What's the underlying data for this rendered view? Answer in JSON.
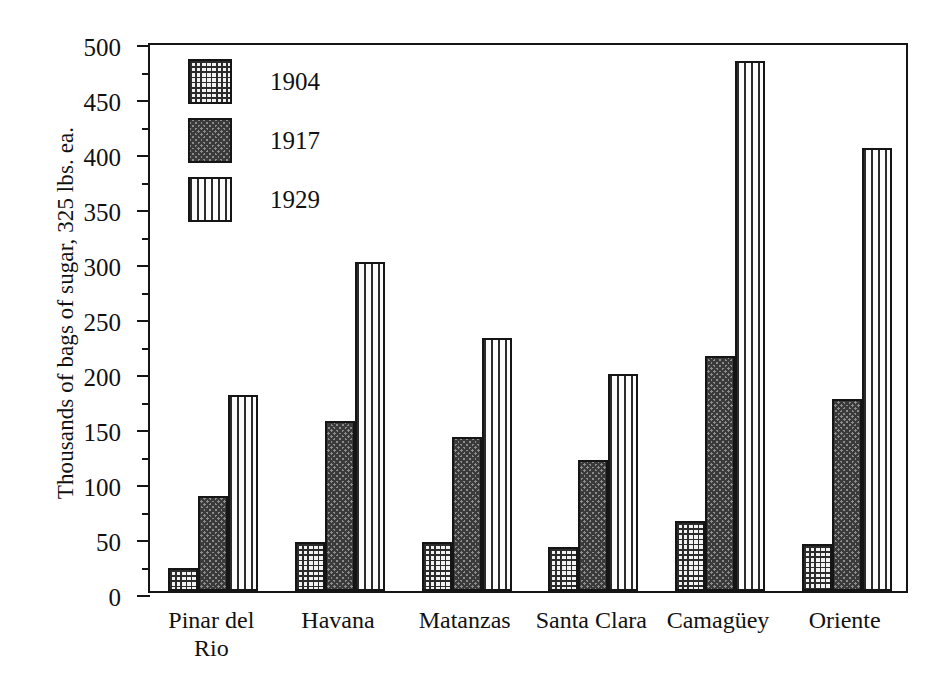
{
  "chart_data": {
    "type": "bar",
    "title": "",
    "xlabel": "",
    "ylabel": "Thousands of bags of sugar, 325 lbs. ea.",
    "ylim": [
      0,
      500
    ],
    "ytick_step": 50,
    "yticks": [
      0,
      50,
      100,
      150,
      200,
      250,
      300,
      350,
      400,
      450,
      500
    ],
    "ytick_labels": [
      "0",
      "50",
      "100",
      "150",
      "200",
      "250",
      "300",
      "350",
      "400",
      "450",
      "500"
    ],
    "minor_ticks": true,
    "minor_tick_step": 25,
    "grid": false,
    "legend_position": "upper-left-inside",
    "categories": [
      "Pinar del Rio",
      "Havana",
      "Matanzas",
      "Santa Clara",
      "Camagüey",
      "Oriente"
    ],
    "category_labels": [
      "Pinar del\nRio",
      "Havana",
      "Matanzas",
      "Santa Clara",
      "Camagüey",
      "Oriente"
    ],
    "series": [
      {
        "name": "1904",
        "pattern": "fine-square-grid",
        "values": [
          21,
          45,
          45,
          40,
          64,
          43
        ]
      },
      {
        "name": "1917",
        "pattern": "dense-diagonal-crosshatch",
        "values": [
          86,
          155,
          140,
          119,
          214,
          175
        ]
      },
      {
        "name": "1929",
        "pattern": "vertical-stripes",
        "values": [
          178,
          299,
          230,
          197,
          482,
          403
        ]
      }
    ]
  },
  "legend": {
    "entries": [
      {
        "label": "1904"
      },
      {
        "label": "1917"
      },
      {
        "label": "1929"
      }
    ]
  },
  "axis": {
    "y_title": "Thousands of bags of sugar, 325 lbs. ea."
  },
  "colors": {
    "ink": "#151515",
    "background": "#ffffff",
    "series_1904": "#f2f2f2",
    "series_1917": "#8d8d8d",
    "series_1929": "#fbfbfb"
  }
}
